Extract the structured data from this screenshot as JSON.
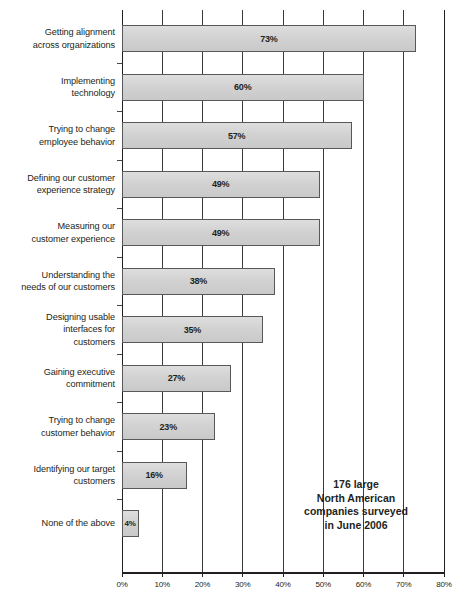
{
  "chart_data": {
    "type": "bar",
    "orientation": "horizontal",
    "title": "",
    "xlabel": "",
    "ylabel": "",
    "xlim": [
      0,
      80
    ],
    "xticks": [
      0,
      10,
      20,
      30,
      40,
      50,
      60,
      70,
      80
    ],
    "xtick_labels": [
      "0%",
      "10%",
      "20%",
      "30%",
      "40%",
      "50%",
      "60%",
      "70%",
      "80%"
    ],
    "grid": "vertical",
    "legend": "none",
    "value_suffix": "%",
    "categories": [
      "Getting alignment across organizations",
      "Implementing technology",
      "Trying to change employee behavior",
      "Defining our customer experience strategy",
      "Measuring our customer experience",
      "Understanding the needs of our customers",
      "Designing usable interfaces for customers",
      "Gaining executive commitment",
      "Trying to change customer behavior",
      "Identifying our target customers",
      "None of the above"
    ],
    "category_lines": [
      [
        "Getting alignment",
        "across organizations"
      ],
      [
        "Implementing",
        "technology"
      ],
      [
        "Trying to change",
        "employee behavior"
      ],
      [
        "Defining our customer",
        "experience strategy"
      ],
      [
        "Measuring our",
        "customer experience"
      ],
      [
        "Understanding the",
        "needs of our customers"
      ],
      [
        "Designing usable",
        "interfaces for",
        "customers"
      ],
      [
        "Gaining executive",
        "commitment"
      ],
      [
        "Trying to change",
        "customer behavior"
      ],
      [
        "Identifying our target",
        "customers"
      ],
      [
        "None of the above"
      ]
    ],
    "values": [
      73,
      60,
      57,
      49,
      49,
      38,
      35,
      27,
      23,
      16,
      4
    ],
    "value_labels": [
      "73%",
      "60%",
      "57%",
      "49%",
      "49%",
      "38%",
      "35%",
      "27%",
      "23%",
      "16%",
      "4%"
    ],
    "bar_fill_color": "#d2d2d2",
    "bar_border_color": "#58585a",
    "axis_color": "#231f20",
    "gridline_color": "#3c3c3c"
  },
  "annotation": {
    "lines": [
      "176 large",
      "North American",
      "companies surveyed",
      "in June 2006"
    ]
  }
}
